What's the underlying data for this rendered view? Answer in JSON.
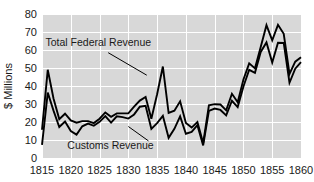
{
  "chart_data": {
    "type": "line",
    "title": "",
    "xlabel": "",
    "ylabel": "$ Millions",
    "xlim": [
      1815,
      1860
    ],
    "ylim": [
      0,
      80
    ],
    "grid": true,
    "legend_position": "inline-annotations",
    "xticks": [
      1815,
      1820,
      1825,
      1830,
      1835,
      1840,
      1845,
      1850,
      1855,
      1860
    ],
    "xtick_labels": [
      "1815",
      "1820",
      "1825",
      "1830",
      "1835",
      "1840",
      "1845",
      "1850",
      "1855",
      "1860"
    ],
    "yticks": [
      0,
      10,
      20,
      30,
      40,
      50,
      60,
      70,
      80
    ],
    "ytick_labels": [
      "0",
      "10",
      "20",
      "30",
      "40",
      "50",
      "60",
      "70",
      "80"
    ],
    "x": [
      1815,
      1816,
      1817,
      1818,
      1819,
      1820,
      1821,
      1822,
      1823,
      1824,
      1825,
      1826,
      1827,
      1828,
      1829,
      1830,
      1831,
      1832,
      1833,
      1834,
      1835,
      1836,
      1837,
      1838,
      1839,
      1840,
      1841,
      1842,
      1843,
      1844,
      1845,
      1846,
      1847,
      1848,
      1849,
      1850,
      1851,
      1852,
      1853,
      1854,
      1855,
      1856,
      1857,
      1858,
      1859,
      1860
    ],
    "series": [
      {
        "name": "Total Federal Revenue",
        "color": "#000000",
        "annotation": "Total Federal Revenue",
        "values": [
          15.7,
          49.0,
          33.1,
          21.6,
          24.6,
          20.9,
          19.6,
          20.5,
          20.5,
          19.4,
          21.8,
          25.3,
          22.9,
          24.8,
          24.8,
          24.8,
          28.5,
          31.9,
          33.9,
          21.8,
          35.4,
          50.8,
          25.0,
          26.3,
          31.5,
          19.5,
          16.9,
          20.0,
          8.3,
          29.3,
          29.9,
          29.7,
          26.5,
          35.7,
          31.0,
          43.6,
          52.6,
          49.8,
          61.6,
          73.8,
          65.4,
          74.0,
          69.0,
          46.7,
          53.5,
          56.0
        ]
      },
      {
        "name": "Customs Revenue",
        "color": "#000000",
        "annotation": "Customs Revenue",
        "values": [
          7.3,
          36.3,
          26.3,
          17.2,
          20.3,
          15.0,
          13.0,
          17.6,
          19.1,
          17.9,
          20.1,
          23.3,
          19.7,
          23.2,
          22.7,
          21.9,
          24.2,
          28.5,
          29.0,
          16.2,
          19.4,
          23.4,
          11.2,
          16.2,
          23.1,
          13.5,
          14.5,
          18.2,
          7.0,
          26.2,
          27.5,
          26.7,
          23.7,
          31.8,
          28.3,
          39.7,
          49.0,
          47.3,
          58.9,
          64.2,
          53.0,
          64.0,
          63.9,
          41.8,
          49.6,
          53.2
        ]
      }
    ],
    "annotations": [
      {
        "text": "Total Federal Revenue",
        "label_x": 1815.6,
        "label_y": 62.5,
        "leader_from_x": 1826.5,
        "leader_from_y": 58.5,
        "leader_to_x": 1833.2,
        "leader_to_y": 46.0
      },
      {
        "text": "Customs Revenue",
        "label_x": 1819.4,
        "label_y": 5.0,
        "leader_from_x": 1833.5,
        "leader_from_y": 9.5,
        "leader_to_x": 1830.0,
        "leader_to_y": 17.5
      }
    ]
  }
}
